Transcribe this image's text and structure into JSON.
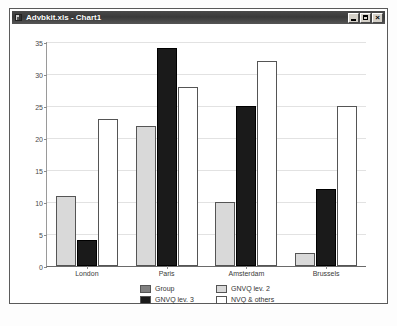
{
  "window": {
    "title": "Advbkit.xls - Chart1",
    "icon": "excel-chart-icon",
    "controls": [
      {
        "name": "minimize-button",
        "glyph": "_"
      },
      {
        "name": "maximize-button",
        "glyph": "□"
      },
      {
        "name": "close-button",
        "glyph": "×"
      }
    ]
  },
  "colors": {
    "series_group": "#808080",
    "series_gnvq2": "#d9d9d9",
    "series_gnvq3": "#1a1a1a",
    "series_nvq_others": "#ffffff",
    "gridline": "#e2e2e2",
    "axis": "#6a6a6a",
    "titlebar": "#3a3a3a"
  },
  "chart_data": {
    "type": "bar",
    "title": "",
    "subtitle": "",
    "xlabel": "",
    "ylabel": "",
    "grid": true,
    "legend_position": "bottom",
    "ylim": [
      0,
      35
    ],
    "yticks": [
      0,
      5,
      10,
      15,
      20,
      25,
      30,
      35
    ],
    "categories": [
      "London",
      "Paris",
      "Amsterdam",
      "Brussels"
    ],
    "series": [
      {
        "name": "Group",
        "color": "#808080",
        "values": [
          null,
          null,
          null,
          null
        ]
      },
      {
        "name": "GNVQ lev. 2",
        "color": "#d9d9d9",
        "values": [
          11,
          21.8,
          10,
          2
        ]
      },
      {
        "name": "GNVQ lev. 3",
        "color": "#1a1a1a",
        "values": [
          4,
          34,
          25,
          12
        ]
      },
      {
        "name": "NVQ & others",
        "color": "#ffffff",
        "values": [
          23,
          28,
          32,
          25
        ]
      }
    ],
    "legend_entries": [
      "Group",
      "GNVQ lev. 2",
      "GNVQ lev. 3",
      "NVQ & others"
    ]
  }
}
